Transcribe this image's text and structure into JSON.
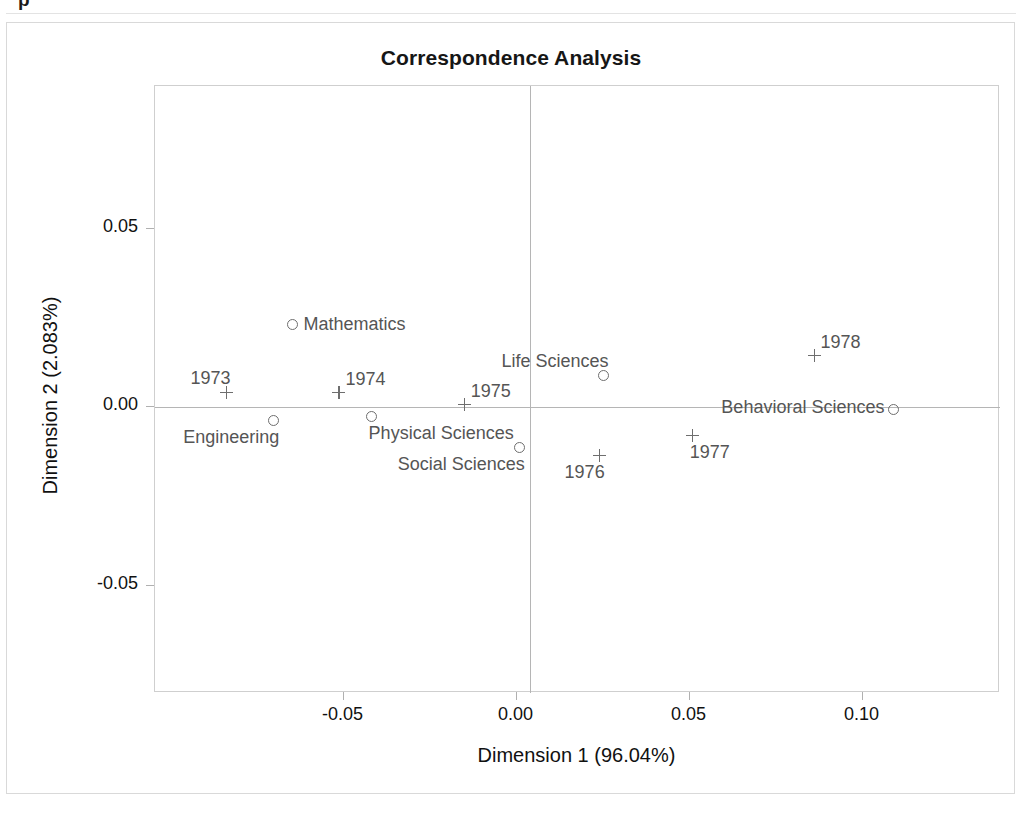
{
  "page": {
    "top_fragment": "p"
  },
  "chart_data": {
    "type": "scatter",
    "title": "Correspondence Analysis",
    "xlabel": "Dimension 1 (96.04%)",
    "ylabel": "Dimension 2 (2.083%)",
    "xlim": [
      -0.1045,
      0.1397
    ],
    "ylim": [
      -0.0801,
      0.0901
    ],
    "xticks": [
      -0.05,
      0.0,
      0.05,
      0.1
    ],
    "xticklabels": [
      "-0.05",
      "0.00",
      "0.05",
      "0.10"
    ],
    "yticks": [
      0.05,
      0.0,
      -0.05
    ],
    "yticklabels": [
      "0.05",
      "0.00",
      "-0.05"
    ],
    "grid": false,
    "legend": "none",
    "zero_reference_lines": true,
    "series": [
      {
        "name": "Field of study (row points)",
        "marker": "circle",
        "points": [
          {
            "label": "Mathematics",
            "x": -0.0645,
            "y": 0.0231,
            "label_pos": "right"
          },
          {
            "label": "Engineering",
            "x": -0.07,
            "y": -0.0038,
            "label_pos": "below-left"
          },
          {
            "label": "Physical Sciences",
            "x": -0.0419,
            "y": -0.0027,
            "label_pos": "below-right"
          },
          {
            "label": "Social Sciences",
            "x": 0.0009,
            "y": -0.0113,
            "label_pos": "below-left"
          },
          {
            "label": "Life Sciences",
            "x": 0.0254,
            "y": 0.0088,
            "label_pos": "above-left"
          },
          {
            "label": "Behavioral Sciences",
            "x": 0.1092,
            "y": -0.0007,
            "label_pos": "left"
          }
        ]
      },
      {
        "name": "Year (column points)",
        "marker": "plus",
        "points": [
          {
            "label": "1973",
            "x": -0.0838,
            "y": 0.0041,
            "label_pos": "above-left"
          },
          {
            "label": "1974",
            "x": -0.0512,
            "y": 0.0041,
            "label_pos": "above-right"
          },
          {
            "label": "1975",
            "x": -0.015,
            "y": 0.0007,
            "label_pos": "above-right"
          },
          {
            "label": "1976",
            "x": 0.024,
            "y": -0.0136,
            "label_pos": "below-left"
          },
          {
            "label": "1977",
            "x": 0.0509,
            "y": -0.008,
            "label_pos": "below-right"
          },
          {
            "label": "1978",
            "x": 0.0861,
            "y": 0.0144,
            "label_pos": "above-right"
          }
        ]
      }
    ]
  }
}
